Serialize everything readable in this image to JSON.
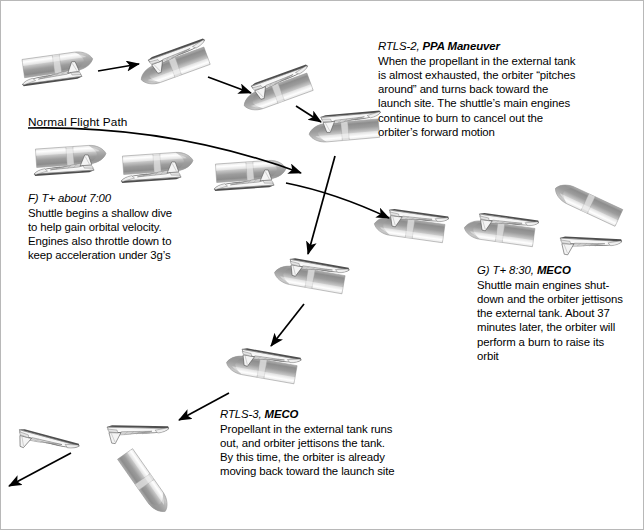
{
  "diagram": {
    "canvas": {
      "width": 644,
      "height": 530
    },
    "background": "#ffffff",
    "border_color": "#b8b8b8",
    "ink_color": "#000000"
  },
  "flight_path_label": "Normal Flight Path",
  "notes": [
    {
      "id": "rtls-2",
      "header_italic": "RTLS-2, ",
      "header_bold": "PPA Maneuver",
      "body": "When the propellant in the external tank\nis almost exhausted, the orbiter “pitches\naround” and turns back toward the\nlaunch site. The shuttle’s main engines\ncontinue to burn to cancel out the\norbiter’s forward motion",
      "x": 377,
      "y": 38,
      "width": 255
    },
    {
      "id": "step-f",
      "header_italic": "F) T+ about 7:00",
      "header_bold": "",
      "body": "Shuttle begins a shallow dive\nto help gain orbital velocity.\nEngines also throttle down to\nkeep acceleration under 3g’s",
      "x": 27,
      "y": 190,
      "width": 200
    },
    {
      "id": "step-g",
      "header_italic": "G) T+ 8:30, ",
      "header_bold": "MECO",
      "body": "Shuttle main engines shut-\ndown and the orbiter jettisons\nthe external tank. About 37\nminutes later, the orbiter will\nperform a burn to raise its\norbit",
      "x": 476,
      "y": 262,
      "width": 168
    },
    {
      "id": "rtls-3",
      "header_italic": "RTLS-3, ",
      "header_bold": "MECO",
      "body": "Propellant in the external tank runs\nout, and orbiter jettisons the tank.\nBy this time, the orbiter is already\nmoving back toward the launch site",
      "x": 219,
      "y": 406,
      "width": 215
    }
  ],
  "vehicles": [
    {
      "name": "stack-ascent-1",
      "type": "stack",
      "x": 55,
      "y": 63,
      "scale": 1.0,
      "rotation": -8
    },
    {
      "name": "stack-pitch-1",
      "type": "stack",
      "x": 175,
      "y": 66,
      "scale": 1.0,
      "rotation": 160
    },
    {
      "name": "stack-pitch-2",
      "type": "stack",
      "x": 278,
      "y": 92,
      "scale": 1.0,
      "rotation": 160
    },
    {
      "name": "stack-pitch-3",
      "type": "stack",
      "x": 345,
      "y": 130,
      "scale": 1.0,
      "rotation": 175
    },
    {
      "name": "stack-dive-1",
      "type": "stack",
      "x": 68,
      "y": 155,
      "scale": 1.0,
      "rotation": -4
    },
    {
      "name": "stack-dive-2",
      "type": "stack",
      "x": 155,
      "y": 162,
      "scale": 1.0,
      "rotation": -4
    },
    {
      "name": "stack-dive-3",
      "type": "stack",
      "x": 248,
      "y": 170,
      "scale": 1.0,
      "rotation": -4
    },
    {
      "name": "stack-return-1",
      "type": "stack",
      "x": 310,
      "y": 278,
      "scale": 1.0,
      "rotation": 190
    },
    {
      "name": "stack-return-2",
      "type": "stack",
      "x": 262,
      "y": 368,
      "scale": 1.0,
      "rotation": 190
    },
    {
      "name": "stack-meco-1",
      "type": "stack",
      "x": 410,
      "y": 228,
      "scale": 1.0,
      "rotation": 188
    },
    {
      "name": "stack-meco-2",
      "type": "stack",
      "x": 500,
      "y": 232,
      "scale": 1.0,
      "rotation": 188
    },
    {
      "name": "tank-jettison-r",
      "type": "tank",
      "x": 588,
      "y": 203,
      "scale": 1.0,
      "rotation": 205
    },
    {
      "name": "orbiter-meco-r",
      "type": "orbiter",
      "x": 590,
      "y": 240,
      "scale": 1.0,
      "rotation": 183
    },
    {
      "name": "orbiter-rtls-1",
      "type": "orbiter",
      "x": 137,
      "y": 428,
      "scale": 1.0,
      "rotation": 181
    },
    {
      "name": "orbiter-rtls-2",
      "type": "orbiter",
      "x": 48,
      "y": 438,
      "scale": 1.0,
      "rotation": 195
    },
    {
      "name": "tank-falling",
      "type": "tank",
      "x": 143,
      "y": 480,
      "scale": 1.0,
      "rotation": 55
    }
  ],
  "arrows": [
    {
      "name": "arrow-ascent-to-pitch",
      "kind": "straight",
      "x1": 97,
      "y1": 70,
      "x2": 138,
      "y2": 63
    },
    {
      "name": "arrow-pitch1-to-pitch2",
      "kind": "straight",
      "x1": 207,
      "y1": 76,
      "x2": 250,
      "y2": 92
    },
    {
      "name": "arrow-pitch2-to-pitch3",
      "kind": "straight",
      "x1": 295,
      "y1": 105,
      "x2": 320,
      "y2": 121
    },
    {
      "name": "arrow-normal-flight",
      "kind": "curve",
      "x1": 27,
      "y1": 127,
      "x2": 300,
      "y2": 172,
      "cx": 170,
      "cy": 124
    },
    {
      "name": "arrow-crossing-right",
      "kind": "curve",
      "x1": 285,
      "y1": 182,
      "x2": 388,
      "y2": 217,
      "cx": 335,
      "cy": 192
    },
    {
      "name": "arrow-crossing-down",
      "kind": "straight",
      "x1": 334,
      "y1": 155,
      "x2": 307,
      "y2": 253
    },
    {
      "name": "arrow-return-down",
      "kind": "straight",
      "x1": 303,
      "y1": 303,
      "x2": 270,
      "y2": 345
    },
    {
      "name": "arrow-to-rtls3",
      "kind": "straight",
      "x1": 228,
      "y1": 392,
      "x2": 178,
      "y2": 419
    },
    {
      "name": "arrow-orbiter-fly-left",
      "kind": "straight",
      "x1": 70,
      "y1": 452,
      "x2": 8,
      "y2": 485
    }
  ],
  "colors": {
    "tank_light": "#f2f2f2",
    "tank_mid": "#b9b9b9",
    "tank_dark": "#8a8a8a",
    "orbiter_body": "#fbfbfb",
    "orbiter_outline": "#4a4a4a",
    "arrow": "#000000"
  }
}
